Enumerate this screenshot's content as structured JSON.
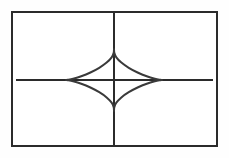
{
  "figure": {
    "title": "",
    "background_color": "#ffffff",
    "frame": {
      "stroke_color": "#2b2b2b",
      "stroke_width": 2,
      "x": 11,
      "y": 11,
      "width": 207,
      "height": 136
    }
  },
  "chart_data": {
    "type": "line",
    "title": "",
    "subtitle": "",
    "xlabel": "",
    "ylabel": "",
    "curve_name": "astroid",
    "equation": "x^(2/3) + y^(2/3) = a^(2/3)",
    "grid": false,
    "legend": "none",
    "xlim": [
      -4.35,
      4.35
    ],
    "ylim": [
      -3.2,
      3.2
    ],
    "axes": {
      "x_axis": {
        "pixel_y": 80,
        "pixel_x_start": 17,
        "pixel_x_end": 212,
        "stroke_color": "#2b2b2b",
        "stroke_width": 2,
        "ticks": [],
        "tick_labels": []
      },
      "y_axis": {
        "pixel_x": 114,
        "pixel_y_start": 14,
        "pixel_y_end": 145,
        "stroke_color": "#2b2b2b",
        "stroke_width": 2,
        "ticks": [],
        "tick_labels": []
      },
      "origin_pixel": [
        114,
        80
      ]
    },
    "series": [
      {
        "name": "astroid",
        "stroke_color": "#3a3a3a",
        "stroke_width": 2,
        "closed": true,
        "parameter": "t from 0 to 2*pi",
        "semi_axis_x_units": 0.92,
        "semi_axis_y_units": 0.72,
        "semi_axis_x_pixels": 48,
        "semi_axis_y_pixels": 31,
        "cusps": [
          {
            "label": "right-cusp",
            "x": 0.92,
            "y": 0.0,
            "pixel": [
              162,
              80
            ]
          },
          {
            "label": "top-cusp",
            "x": 0.0,
            "y": 0.72,
            "pixel": [
              114,
              49
            ]
          },
          {
            "label": "left-cusp",
            "x": -0.92,
            "y": 0.0,
            "pixel": [
              66,
              80
            ]
          },
          {
            "label": "bottom-cusp",
            "x": 0.0,
            "y": -0.72,
            "pixel": [
              114,
              111
            ]
          }
        ],
        "points": [
          {
            "x": 0.92,
            "y": 0.0
          },
          {
            "x": 0.885,
            "y": 0.004
          },
          {
            "x": 0.782,
            "y": 0.029
          },
          {
            "x": 0.628,
            "y": 0.086
          },
          {
            "x": 0.452,
            "y": 0.174
          },
          {
            "x": 0.283,
            "y": 0.283
          },
          {
            "x": 0.141,
            "y": 0.404
          },
          {
            "x": 0.045,
            "y": 0.527
          },
          {
            "x": 0.006,
            "y": 0.634
          },
          {
            "x": 0.0,
            "y": 0.72
          },
          {
            "x": -0.006,
            "y": 0.634
          },
          {
            "x": -0.045,
            "y": 0.527
          },
          {
            "x": -0.141,
            "y": 0.404
          },
          {
            "x": -0.283,
            "y": 0.283
          },
          {
            "x": -0.452,
            "y": 0.174
          },
          {
            "x": -0.628,
            "y": 0.086
          },
          {
            "x": -0.782,
            "y": 0.029
          },
          {
            "x": -0.885,
            "y": 0.004
          },
          {
            "x": -0.92,
            "y": 0.0
          },
          {
            "x": -0.885,
            "y": -0.004
          },
          {
            "x": -0.782,
            "y": -0.029
          },
          {
            "x": -0.628,
            "y": -0.086
          },
          {
            "x": -0.452,
            "y": -0.174
          },
          {
            "x": -0.283,
            "y": -0.283
          },
          {
            "x": -0.141,
            "y": -0.404
          },
          {
            "x": -0.045,
            "y": -0.527
          },
          {
            "x": -0.006,
            "y": -0.634
          },
          {
            "x": 0.0,
            "y": -0.72
          },
          {
            "x": 0.006,
            "y": -0.634
          },
          {
            "x": 0.045,
            "y": -0.527
          },
          {
            "x": 0.141,
            "y": -0.404
          },
          {
            "x": 0.283,
            "y": -0.283
          },
          {
            "x": 0.452,
            "y": -0.174
          },
          {
            "x": 0.628,
            "y": -0.086
          },
          {
            "x": 0.782,
            "y": -0.029
          },
          {
            "x": 0.885,
            "y": -0.004
          },
          {
            "x": 0.92,
            "y": 0.0
          }
        ]
      }
    ]
  }
}
